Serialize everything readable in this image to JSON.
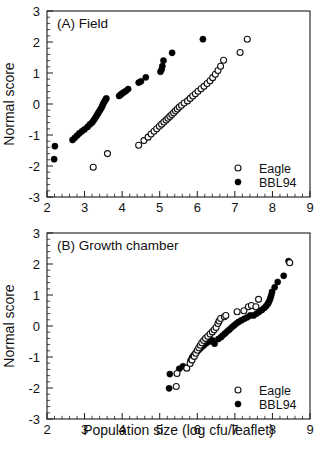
{
  "figure": {
    "axis_labels": {
      "y": "Normal score",
      "x": "Population size (log cfu/leaflet)"
    },
    "legend": {
      "eagle": "Eagle",
      "bbl94": "BBL94"
    },
    "colors": {
      "eagle_marker": "#ffffff",
      "bbl94_marker": "#000000",
      "axis": "#1a1a1a",
      "background": "#ffffff"
    }
  },
  "chart_data": [
    {
      "type": "scatter",
      "panel": "A",
      "title": "(A) Field",
      "xlabel": "",
      "ylabel": "Normal score",
      "xlim": [
        2,
        9
      ],
      "ylim": [
        -3,
        3
      ],
      "xticks": [
        2,
        3,
        4,
        5,
        6,
        7,
        8,
        9
      ],
      "yticks": [
        -3,
        -2,
        -1,
        0,
        1,
        2,
        3
      ],
      "grid": false,
      "legend_position": "bottom-right",
      "series": [
        {
          "name": "BBL94",
          "marker": "filled-circle",
          "points": [
            [
              2.19,
              -1.78
            ],
            [
              2.21,
              -1.36
            ],
            [
              2.68,
              -1.16
            ],
            [
              2.74,
              -1.09
            ],
            [
              2.8,
              -1.02
            ],
            [
              2.86,
              -0.95
            ],
            [
              2.93,
              -0.88
            ],
            [
              3.0,
              -0.82
            ],
            [
              3.08,
              -0.74
            ],
            [
              3.14,
              -0.66
            ],
            [
              3.2,
              -0.6
            ],
            [
              3.24,
              -0.53
            ],
            [
              3.28,
              -0.46
            ],
            [
              3.31,
              -0.4
            ],
            [
              3.34,
              -0.34
            ],
            [
              3.37,
              -0.28
            ],
            [
              3.4,
              -0.22
            ],
            [
              3.43,
              -0.16
            ],
            [
              3.46,
              -0.1
            ],
            [
              3.48,
              -0.04
            ],
            [
              3.5,
              0.02
            ],
            [
              3.53,
              0.08
            ],
            [
              3.56,
              0.14
            ],
            [
              3.58,
              0.18
            ],
            [
              3.92,
              0.26
            ],
            [
              3.96,
              0.3
            ],
            [
              4.0,
              0.34
            ],
            [
              4.05,
              0.38
            ],
            [
              4.1,
              0.42
            ],
            [
              4.16,
              0.48
            ],
            [
              4.44,
              0.69
            ],
            [
              4.5,
              0.73
            ],
            [
              4.63,
              0.86
            ],
            [
              5.02,
              1.04
            ],
            [
              5.05,
              1.11
            ],
            [
              5.07,
              1.22
            ],
            [
              5.1,
              1.4
            ],
            [
              5.33,
              1.65
            ],
            [
              6.15,
              2.09
            ]
          ]
        },
        {
          "name": "Eagle",
          "marker": "open-circle",
          "points": [
            [
              3.23,
              -2.04
            ],
            [
              3.61,
              -1.6
            ],
            [
              4.44,
              -1.33
            ],
            [
              4.58,
              -1.18
            ],
            [
              4.69,
              -1.07
            ],
            [
              4.77,
              -0.97
            ],
            [
              4.85,
              -0.88
            ],
            [
              4.92,
              -0.8
            ],
            [
              4.99,
              -0.72
            ],
            [
              5.05,
              -0.65
            ],
            [
              5.11,
              -0.58
            ],
            [
              5.17,
              -0.52
            ],
            [
              5.22,
              -0.46
            ],
            [
              5.27,
              -0.4
            ],
            [
              5.32,
              -0.34
            ],
            [
              5.37,
              -0.28
            ],
            [
              5.42,
              -0.22
            ],
            [
              5.47,
              -0.16
            ],
            [
              5.52,
              -0.1
            ],
            [
              5.58,
              -0.04
            ],
            [
              5.65,
              0.03
            ],
            [
              5.74,
              0.1
            ],
            [
              5.81,
              0.18
            ],
            [
              5.88,
              0.26
            ],
            [
              5.95,
              0.33
            ],
            [
              6.02,
              0.41
            ],
            [
              6.1,
              0.49
            ],
            [
              6.18,
              0.57
            ],
            [
              6.26,
              0.66
            ],
            [
              6.34,
              0.75
            ],
            [
              6.41,
              0.85
            ],
            [
              6.48,
              0.96
            ],
            [
              6.55,
              1.08
            ],
            [
              6.62,
              1.22
            ],
            [
              6.7,
              1.41
            ],
            [
              7.14,
              1.66
            ],
            [
              7.33,
              2.09
            ]
          ]
        }
      ]
    },
    {
      "type": "scatter",
      "panel": "B",
      "title": "(B) Growth chamber",
      "xlabel": "Population size (log cfu/leaflet)",
      "ylabel": "Normal score",
      "xlim": [
        2,
        9
      ],
      "ylim": [
        -3,
        3
      ],
      "xticks": [
        2,
        3,
        4,
        5,
        6,
        7,
        8,
        9
      ],
      "yticks": [
        -3,
        -2,
        -1,
        0,
        1,
        2,
        3
      ],
      "grid": false,
      "legend_position": "bottom-right",
      "series": [
        {
          "name": "BBL94",
          "marker": "filled-circle",
          "points": [
            [
              5.25,
              -2.01
            ],
            [
              5.27,
              -1.55
            ],
            [
              5.52,
              -1.38
            ],
            [
              5.62,
              -1.3
            ],
            [
              5.82,
              -1.12
            ],
            [
              5.86,
              -1.02
            ],
            [
              5.9,
              -0.95
            ],
            [
              5.95,
              -0.88
            ],
            [
              6.0,
              -0.82
            ],
            [
              6.05,
              -0.76
            ],
            [
              6.1,
              -0.7
            ],
            [
              6.17,
              -0.63
            ],
            [
              6.24,
              -0.56
            ],
            [
              6.33,
              -0.5
            ],
            [
              6.4,
              -0.46
            ],
            [
              6.46,
              -0.57
            ],
            [
              6.56,
              -0.42
            ],
            [
              6.63,
              -0.36
            ],
            [
              6.68,
              -0.3
            ],
            [
              6.74,
              -0.24
            ],
            [
              6.8,
              -0.17
            ],
            [
              6.86,
              -0.11
            ],
            [
              6.92,
              -0.04
            ],
            [
              6.98,
              0.02
            ],
            [
              7.04,
              0.08
            ],
            [
              7.1,
              0.13
            ],
            [
              7.17,
              0.18
            ],
            [
              7.25,
              0.23
            ],
            [
              7.33,
              0.28
            ],
            [
              7.41,
              0.34
            ],
            [
              7.5,
              0.34
            ],
            [
              7.58,
              0.4
            ],
            [
              7.65,
              0.46
            ],
            [
              7.72,
              0.52
            ],
            [
              7.78,
              0.58
            ],
            [
              7.83,
              0.64
            ],
            [
              7.87,
              0.7
            ],
            [
              7.9,
              0.76
            ],
            [
              7.93,
              0.84
            ],
            [
              7.95,
              0.92
            ],
            [
              7.97,
              1.0
            ],
            [
              7.99,
              1.1
            ],
            [
              8.06,
              1.25
            ],
            [
              8.14,
              1.42
            ],
            [
              8.3,
              1.62
            ],
            [
              8.43,
              2.09
            ]
          ]
        },
        {
          "name": "Eagle",
          "marker": "open-circle",
          "points": [
            [
              5.44,
              -1.95
            ],
            [
              5.46,
              -1.53
            ],
            [
              5.72,
              -1.36
            ],
            [
              5.81,
              -1.21
            ],
            [
              5.86,
              -1.1
            ],
            [
              5.92,
              -0.98
            ],
            [
              5.96,
              -0.88
            ],
            [
              6.0,
              -0.78
            ],
            [
              6.04,
              -0.7
            ],
            [
              6.08,
              -0.62
            ],
            [
              6.12,
              -0.54
            ],
            [
              6.17,
              -0.47
            ],
            [
              6.22,
              -0.4
            ],
            [
              6.28,
              -0.33
            ],
            [
              6.34,
              -0.26
            ],
            [
              6.4,
              -0.19
            ],
            [
              6.45,
              -0.12
            ],
            [
              6.5,
              -0.05
            ],
            [
              6.55,
              0.08
            ],
            [
              6.58,
              0.16
            ],
            [
              6.62,
              0.24
            ],
            [
              6.72,
              0.3
            ],
            [
              6.76,
              0.34
            ],
            [
              7.06,
              0.46
            ],
            [
              7.24,
              0.49
            ],
            [
              7.36,
              0.62
            ],
            [
              7.44,
              0.66
            ],
            [
              7.56,
              0.62
            ],
            [
              7.63,
              0.86
            ],
            [
              8.46,
              2.04
            ]
          ]
        }
      ]
    }
  ]
}
